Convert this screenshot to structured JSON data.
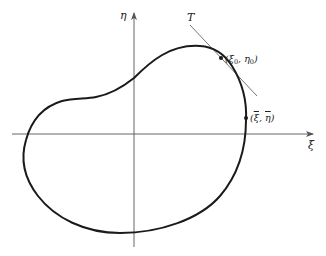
{
  "diagram": {
    "axes": {
      "horizontal_label": "ξ",
      "vertical_label": "η"
    },
    "tangent": {
      "label": "T"
    },
    "points": [
      {
        "label_open": "(",
        "var1": "ξ",
        "sub1": "0",
        "sep": ", ",
        "var2": "η",
        "sub2": "0",
        "label_close": ")",
        "description": "point of tangency"
      },
      {
        "label_open": "(",
        "var1": "ξ",
        "sep": ", ",
        "var2": "η",
        "label_close": ")",
        "overbar": true,
        "description": "marked point on curve"
      }
    ],
    "colors": {
      "curve": "#1a1a1a",
      "axes": "#555555",
      "tangent": "#666666",
      "background": "#ffffff"
    }
  }
}
